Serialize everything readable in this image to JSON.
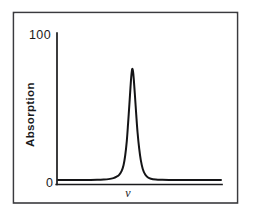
{
  "figure": {
    "background_color": "#ffffff",
    "frame_color": "#3a3a3e",
    "line_color": "#141416",
    "caption": ""
  },
  "axes": {
    "y_axis_title": "Absorption",
    "y_axis_top_label": "100",
    "y_axis_origin_label": "0",
    "x_axis_title": "ν"
  },
  "chart_data": {
    "type": "line",
    "title": "",
    "xlabel": "ν",
    "ylabel": "Absorption",
    "xlim": [
      0,
      100
    ],
    "ylim": [
      0,
      100
    ],
    "grid": false,
    "legend": null,
    "tick_labels": {
      "y": [
        "0",
        "100"
      ],
      "x": []
    },
    "annotations": [],
    "series": [
      {
        "name": "Absorption line",
        "peak_center_x": 45.5,
        "peak_height_y": 78,
        "baseline_y": 2.5,
        "fwhm_x": 7.5,
        "x": [
          0,
          4,
          8,
          12,
          16,
          20,
          24,
          28,
          31,
          34,
          36,
          37.5,
          39,
          40.2,
          41.2,
          42.2,
          43.0,
          43.8,
          44.5,
          45.0,
          45.5,
          46.0,
          46.5,
          47.2,
          48.0,
          48.8,
          49.8,
          50.8,
          52.0,
          53.5,
          55.0,
          57.0,
          60.0,
          64,
          68,
          74,
          80,
          88,
          96,
          100
        ],
        "values": [
          2.5,
          2.5,
          2.5,
          2.5,
          2.5,
          2.5,
          2.6,
          2.8,
          3.1,
          3.8,
          4.8,
          6.0,
          8.5,
          12.5,
          19.0,
          29.0,
          41.0,
          54.0,
          66.0,
          73.5,
          78.0,
          76.5,
          71.0,
          60.0,
          47.0,
          35.0,
          24.0,
          16.0,
          10.0,
          6.2,
          4.4,
          3.3,
          2.8,
          2.6,
          2.5,
          2.5,
          2.5,
          2.5,
          2.5,
          2.5
        ]
      }
    ]
  }
}
